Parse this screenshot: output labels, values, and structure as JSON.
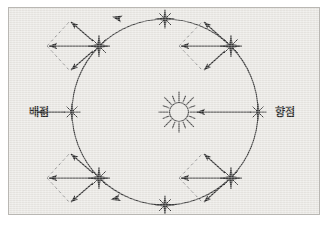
{
  "figure": {
    "kind": "astronomy-diagram",
    "background_color": "#e9e7e3",
    "border_color": "#b9b7b3",
    "ink_color": "#2b2b2b",
    "dashed_color": "#8d8d8d",
    "page_background": "#ffffff"
  },
  "labels": {
    "left": "배점",
    "right": "향점"
  },
  "center_body": {
    "icon": "sun-icon",
    "cx": 170,
    "cy": 104,
    "core_radius": 10,
    "ray_count": 16,
    "ray_length": 11
  },
  "orbit": {
    "icon": "orbit-circle",
    "cx": 156,
    "cy": 104,
    "radius": 93,
    "stroke_width": 1.1,
    "direction_arrows": [
      {
        "name": "orbit-direction-arrow-top",
        "x": 140,
        "y": 13,
        "angle": 188
      },
      {
        "name": "orbit-direction-arrow-bottom",
        "x": 140,
        "y": 196,
        "angle": 172
      }
    ]
  },
  "stars": [
    {
      "name": "star-top",
      "cx": 156,
      "cy": 11,
      "size": 9,
      "position": "top"
    },
    {
      "name": "star-bottom",
      "cx": 156,
      "cy": 197,
      "size": 9,
      "position": "bottom"
    },
    {
      "name": "star-left",
      "cx": 63,
      "cy": 104,
      "size": 9,
      "position": "left"
    },
    {
      "name": "star-right",
      "cx": 249,
      "cy": 104,
      "size": 9,
      "position": "right"
    },
    {
      "name": "star-upper-left",
      "cx": 90,
      "cy": 38,
      "size": 11,
      "position": "upper-left"
    },
    {
      "name": "star-upper-right",
      "cx": 222,
      "cy": 38,
      "size": 11,
      "position": "upper-right"
    },
    {
      "name": "star-lower-left",
      "cx": 90,
      "cy": 170,
      "size": 11,
      "position": "lower-left"
    },
    {
      "name": "star-lower-right",
      "cx": 222,
      "cy": 170,
      "size": 11,
      "position": "lower-right"
    }
  ],
  "axis_arrows": [
    {
      "name": "aberration-arrow-left",
      "x1": 118,
      "y1": 104,
      "x2": 56,
      "y2": 104
    },
    {
      "name": "aberration-arrow-right",
      "x1": 244,
      "y1": 104,
      "x2": 188,
      "y2": 104
    }
  ],
  "vector_groups": [
    {
      "name": "vector-group-upper-left",
      "star": "star-upper-left",
      "apex_x": 90,
      "apex_y": 38,
      "horizontal_arrow": {
        "name": "resultant-arrow",
        "x1": 90,
        "y1": 38,
        "x2": 38,
        "y2": 38
      },
      "arrow_up": {
        "name": "component-arrow-up",
        "x1": 90,
        "y1": 38,
        "x2": 60,
        "y2": 12
      },
      "arrow_down": {
        "name": "component-arrow-down",
        "x1": 90,
        "y1": 38,
        "x2": 60,
        "y2": 62
      },
      "dashed_path": "M 38 38 L 60 12 M 38 38 L 60 62"
    },
    {
      "name": "vector-group-upper-right",
      "star": "star-upper-right",
      "apex_x": 222,
      "apex_y": 38,
      "horizontal_arrow": {
        "name": "resultant-arrow",
        "x1": 222,
        "y1": 38,
        "x2": 170,
        "y2": 38
      },
      "arrow_up": {
        "name": "component-arrow-up",
        "x1": 222,
        "y1": 38,
        "x2": 194,
        "y2": 12
      },
      "arrow_down": {
        "name": "component-arrow-down",
        "x1": 222,
        "y1": 38,
        "x2": 194,
        "y2": 62
      },
      "dashed_path": "M 170 38 L 194 12 M 170 38 L 194 62"
    },
    {
      "name": "vector-group-lower-left",
      "star": "star-lower-left",
      "apex_x": 90,
      "apex_y": 170,
      "horizontal_arrow": {
        "name": "resultant-arrow",
        "x1": 90,
        "y1": 170,
        "x2": 38,
        "y2": 170
      },
      "arrow_up": {
        "name": "component-arrow-up",
        "x1": 90,
        "y1": 170,
        "x2": 60,
        "y2": 146
      },
      "arrow_down": {
        "name": "component-arrow-down",
        "x1": 90,
        "y1": 170,
        "x2": 60,
        "y2": 194
      },
      "dashed_path": "M 38 170 L 60 146 M 38 170 L 60 194"
    },
    {
      "name": "vector-group-lower-right",
      "star": "star-lower-right",
      "apex_x": 222,
      "apex_y": 170,
      "horizontal_arrow": {
        "name": "resultant-arrow",
        "x1": 222,
        "y1": 170,
        "x2": 170,
        "y2": 170
      },
      "arrow_up": {
        "name": "component-arrow-up",
        "x1": 222,
        "y1": 170,
        "x2": 194,
        "y2": 146
      },
      "arrow_down": {
        "name": "component-arrow-down",
        "x1": 222,
        "y1": 170,
        "x2": 194,
        "y2": 194
      },
      "dashed_path": "M 170 170 L 194 146 M 170 170 L 194 194"
    }
  ],
  "label_positions": {
    "left": {
      "x": 20,
      "y": 108,
      "anchor": "start"
    },
    "right": {
      "x": 268,
      "y": 108,
      "anchor": "start"
    }
  }
}
